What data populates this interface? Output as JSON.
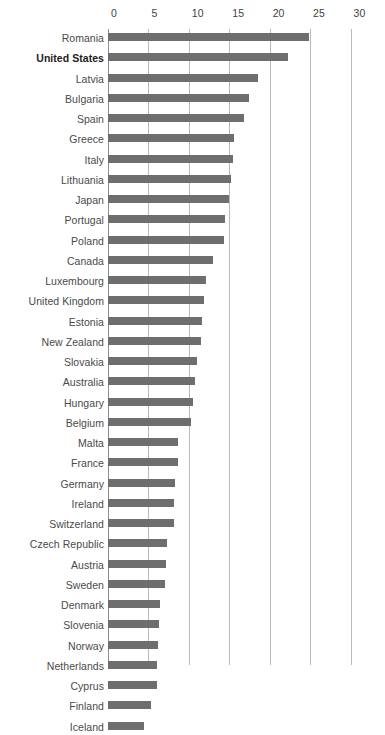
{
  "chart_data": {
    "type": "bar",
    "orientation": "horizontal",
    "title": "",
    "subtitle": "",
    "xlabel": "",
    "ylabel": "",
    "xlim": [
      0,
      30
    ],
    "ylim": null,
    "grid": "vertical",
    "legend": "none",
    "bar_color": "#6e6e6e",
    "gridline_color": "#b9b9b9",
    "axis_color": "#8d8d8d",
    "highlight_color": "#1d1d1d",
    "highlighted_category": "United States",
    "xticks": [
      0,
      5,
      10,
      15,
      20,
      25,
      30
    ],
    "xticklabels": [
      "0",
      "5",
      "10",
      "15",
      "20",
      "25",
      "30"
    ],
    "categories": [
      "Romania",
      "United States",
      "Latvia",
      "Bulgaria",
      "Spain",
      "Greece",
      "Italy",
      "Lithuania",
      "Japan",
      "Portugal",
      "Poland",
      "Canada",
      "Luxembourg",
      "United Kingdom",
      "Estonia",
      "New Zealand",
      "Slovakia",
      "Australia",
      "Hungary",
      "Belgium",
      "Malta",
      "France",
      "Germany",
      "Ireland",
      "Switzerland",
      "Czech Republic",
      "Austria",
      "Sweden",
      "Denmark",
      "Slovenia",
      "Norway",
      "Netherlands",
      "Cyprus",
      "Finland",
      "Iceland"
    ],
    "values": [
      24.9,
      22.3,
      18.5,
      17.4,
      16.8,
      15.6,
      15.5,
      15.2,
      15.0,
      14.5,
      14.4,
      13.0,
      12.1,
      11.9,
      11.6,
      11.5,
      11.0,
      10.8,
      10.5,
      10.3,
      8.7,
      8.6,
      8.3,
      8.2,
      8.2,
      7.3,
      7.2,
      7.1,
      6.4,
      6.3,
      6.2,
      6.0,
      6.0,
      5.3,
      4.5
    ]
  }
}
